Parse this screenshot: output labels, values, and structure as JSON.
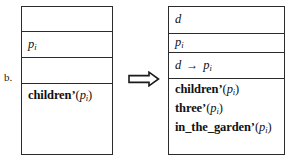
{
  "figure": {
    "label": "b.",
    "relation_symbol": "⟹",
    "relation_name": "double-right-arrow",
    "colors": {
      "ink": "#111111",
      "border": "#2b2b2b",
      "background": "#ffffff"
    }
  },
  "left_stack": {
    "name": "before-stack",
    "cells": [
      {
        "id": "l0",
        "kind": "empty",
        "text": ""
      },
      {
        "id": "l1",
        "kind": "math",
        "text": "p",
        "subscript": "i"
      },
      {
        "id": "l2",
        "kind": "empty",
        "text": ""
      },
      {
        "id": "l3",
        "kind": "predicate",
        "predicate": "children",
        "prime": "’",
        "arg": "p",
        "arg_subscript": "i"
      }
    ]
  },
  "right_stack": {
    "name": "after-stack",
    "cells": [
      {
        "id": "r0",
        "kind": "math",
        "text": "d"
      },
      {
        "id": "r1",
        "kind": "math",
        "text": "p",
        "subscript": "i"
      },
      {
        "id": "r2",
        "kind": "math-arrow",
        "left": "d",
        "arrow": "→",
        "right": "p",
        "right_subscript": "i"
      },
      {
        "id": "r3",
        "kind": "predicate-list",
        "items": [
          {
            "predicate": "children",
            "prime": "’",
            "arg": "p",
            "arg_subscript": "i"
          },
          {
            "predicate": "three",
            "prime": "’",
            "arg": "p",
            "arg_subscript": "i"
          },
          {
            "predicate": "in_the_garden",
            "prime": "’",
            "arg": "p",
            "arg_subscript": "i"
          }
        ]
      }
    ]
  }
}
